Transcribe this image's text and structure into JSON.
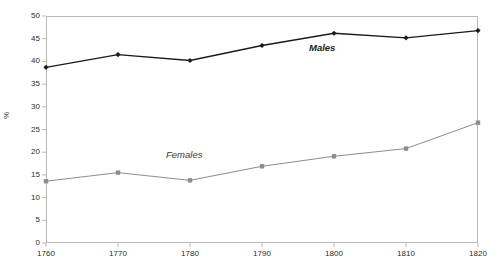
{
  "chart_data": {
    "type": "line",
    "title": "",
    "xlabel": "",
    "ylabel": "%",
    "xlim": [
      1760,
      1820
    ],
    "ylim": [
      0,
      50
    ],
    "grid": false,
    "legend_position": "inline-annotations",
    "x": [
      1760,
      1770,
      1780,
      1790,
      1800,
      1810,
      1820
    ],
    "xtick_labels": [
      "1760",
      "1770",
      "1780",
      "1790",
      "1800",
      "1810",
      "1820"
    ],
    "ytick_labels": [
      "0",
      "5",
      "10",
      "15",
      "20",
      "25",
      "30",
      "35",
      "40",
      "45",
      "50"
    ],
    "ytick_values": [
      0,
      5,
      10,
      15,
      20,
      25,
      30,
      35,
      40,
      45,
      50
    ],
    "series": [
      {
        "name": "Males",
        "color": "#1a1a1a",
        "marker": "diamond",
        "values": [
          38.7,
          41.5,
          40.2,
          43.5,
          46.2,
          45.2,
          46.8
        ]
      },
      {
        "name": "Females",
        "color": "#8c8c8c",
        "marker": "square",
        "values": [
          13.6,
          15.5,
          13.8,
          16.9,
          19.1,
          20.8,
          26.5
        ]
      }
    ],
    "annotations": [
      {
        "text": "Males",
        "x": 1800,
        "y": 44.0
      },
      {
        "text": "Females",
        "x": 1782,
        "y": 20.5
      }
    ],
    "colors": {
      "males_line": "#1a1a1a",
      "females_line": "#8c8c8c",
      "axis": "#b9b9b9",
      "text": "#2b2b2b",
      "background": "#ffffff"
    }
  }
}
